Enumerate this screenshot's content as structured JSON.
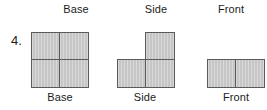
{
  "page": {
    "item_number": "4.",
    "background_color": "#ffffff",
    "text_color": "#1c1c1c",
    "cell_fill_color": "#c6c6c6",
    "cell_border_color": "#5a5a5a"
  },
  "column_headers": [
    {
      "label": "Base"
    },
    {
      "label": "Side"
    },
    {
      "label": "Front"
    }
  ],
  "column_footers": [
    {
      "label": "Base"
    },
    {
      "label": "Side"
    },
    {
      "label": "Front"
    }
  ],
  "shapes": [
    {
      "name": "base",
      "title": "Base",
      "rows": 2,
      "cols": 2,
      "square_count": 4,
      "grid": [
        [
          1,
          1
        ],
        [
          1,
          1
        ]
      ]
    },
    {
      "name": "side",
      "title": "Side",
      "rows": 2,
      "cols": 2,
      "square_count": 3,
      "grid": [
        [
          0,
          1
        ],
        [
          1,
          1
        ]
      ]
    },
    {
      "name": "front",
      "title": "Front",
      "rows": 1,
      "cols": 2,
      "square_count": 2,
      "grid": [
        [
          1,
          1
        ]
      ]
    }
  ]
}
